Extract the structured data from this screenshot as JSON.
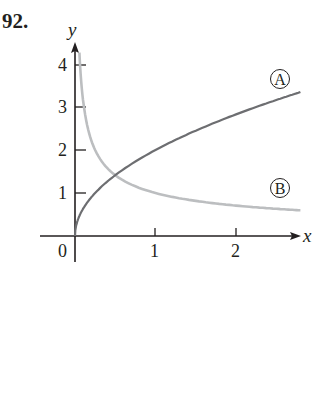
{
  "problem_number": "92.",
  "chart_data": {
    "type": "line",
    "title": "",
    "xlabel": "x",
    "ylabel": "y",
    "xlim": [
      0,
      2.8
    ],
    "ylim": [
      0,
      4.3
    ],
    "x_ticks": [
      0,
      1,
      2
    ],
    "x_tick_labels": [
      "0",
      "1",
      "2"
    ],
    "y_ticks": [
      1,
      2,
      3,
      4
    ],
    "y_tick_labels": [
      "1",
      "2",
      "3",
      "4"
    ],
    "grid": false,
    "legend": "inline circled labels near right end of curves",
    "series": [
      {
        "name": "A",
        "color": "#6d6e71",
        "x": [
          0,
          0.05,
          0.1,
          0.25,
          0.5,
          1,
          1.5,
          2,
          2.5,
          2.8
        ],
        "values": [
          0,
          0.45,
          0.63,
          1.0,
          1.41,
          2.0,
          2.45,
          2.83,
          3.16,
          3.35
        ]
      },
      {
        "name": "B",
        "color": "#bcbec0",
        "x": [
          0.055,
          0.1,
          0.25,
          0.5,
          1,
          1.5,
          2,
          2.5,
          2.8
        ],
        "values": [
          4.26,
          3.16,
          2.0,
          1.41,
          1.0,
          0.82,
          0.71,
          0.63,
          0.6
        ]
      }
    ]
  },
  "labels": {
    "x_axis": "x",
    "y_axis": "y",
    "curve_a": "A",
    "curve_b": "B",
    "origin": "0",
    "xt1": "1",
    "xt2": "2",
    "yt1": "1",
    "yt2": "2",
    "yt3": "3",
    "yt4": "4"
  }
}
